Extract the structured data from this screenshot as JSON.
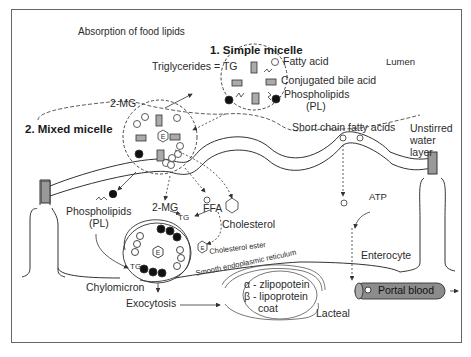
{
  "title": "Absorption of food lipids",
  "sections": {
    "simple_micelle": "1. Simple micelle",
    "mixed_micelle": "2. Mixed micelle"
  },
  "labels": {
    "triglycerides": "Triglycerides = TG",
    "fatty_acid": "Fatty acid",
    "conjugated_bile_acid": "Conjugated bile acid",
    "phospholipids_top": "Phospholipids",
    "pl_top": "(PL)",
    "lumen": "Lumen",
    "two_mg_top": "2-MG",
    "short_chain": "Short chain fatty acids",
    "unstirred_1": "Unstirred",
    "unstirred_2": "water",
    "unstirred_3": "layer",
    "phospholipids_bottom": "Phospholipids",
    "pl_bottom": "(PL)",
    "two_mg_bottom": "2-MG",
    "tg": "TG",
    "ffa": "FFA",
    "cholesterol": "Cholesterol",
    "atp": "ATP",
    "cholesterol_ester": "Cholesterol ester",
    "ser": "Smooth endoplasmic reticulum",
    "enterocyte": "Enterocyte",
    "chylomicron": "Chylomicron",
    "exocytosis": "Exocytosis",
    "alpha_line": "α - zlipopotein",
    "beta_line": "β - lipoprotein",
    "coat": "coat",
    "lacteal": "Lacteal",
    "portal_blood": "Portal blood",
    "tg_inner": "TG",
    "ester_symbol": "E"
  },
  "colors": {
    "line": "#333333",
    "tube_fill": "#8a8a8a",
    "cap_fill": "#9a9a9a",
    "dot": "#111111"
  }
}
